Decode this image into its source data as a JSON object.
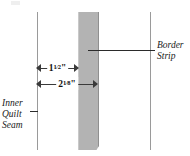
{
  "diagram": {
    "background_color": "#ffffff",
    "strip_color": "#b3b3b3",
    "line_color": "#9a9a9a",
    "text_color": "#1a1a1a"
  },
  "labels": {
    "border_strip": {
      "line1": "Border",
      "line2": "Strip"
    },
    "inner_quilt_seam": {
      "line1": "Inner",
      "line2": "Quilt",
      "line3": "Seam"
    }
  },
  "dimensions": [
    {
      "id": "dim-1",
      "whole": "1",
      "numerator": "1",
      "slash": "⁄",
      "denominator": "2",
      "unit": "\"",
      "full_text": "1 1/2\""
    },
    {
      "id": "dim-2",
      "whole": "2",
      "numerator": "1",
      "slash": "⁄",
      "denominator": "8",
      "unit": "\"",
      "full_text": "2 1/8\""
    }
  ]
}
